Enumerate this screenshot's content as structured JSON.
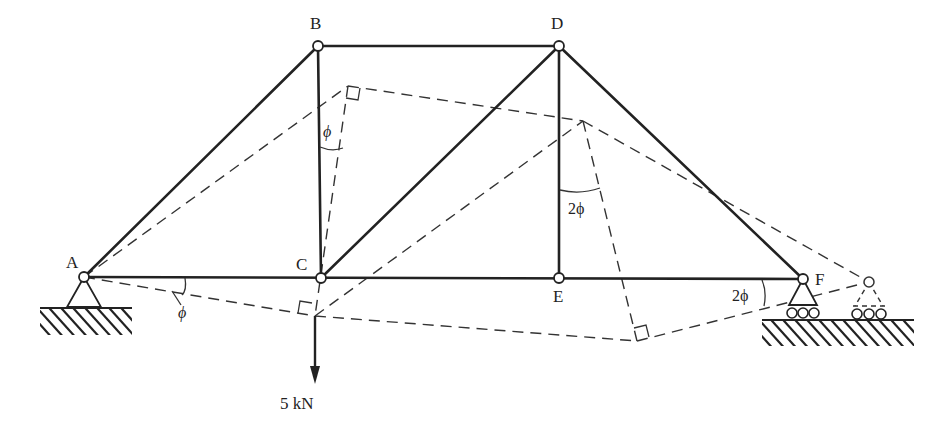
{
  "diagram": {
    "type": "truss-displacement-diagram",
    "joints": [
      {
        "id": "A",
        "label": "A",
        "x": 84,
        "y": 277,
        "support": "pin"
      },
      {
        "id": "B",
        "label": "B",
        "x": 318,
        "y": 46
      },
      {
        "id": "C",
        "label": "C",
        "x": 321,
        "y": 278
      },
      {
        "id": "D",
        "label": "D",
        "x": 559,
        "y": 46
      },
      {
        "id": "E",
        "label": "E",
        "x": 559,
        "y": 278
      },
      {
        "id": "F",
        "label": "F",
        "x": 803,
        "y": 279,
        "support": "roller"
      }
    ],
    "members": [
      "AB",
      "BC",
      "BD",
      "AC",
      "CE",
      "EF",
      "CD",
      "DE",
      "DF"
    ],
    "displaced_joints": [
      {
        "id": "B'",
        "x": 348,
        "y": 86
      },
      {
        "id": "C'",
        "x": 315,
        "y": 316
      },
      {
        "id": "D'",
        "x": 583,
        "y": 121
      },
      {
        "id": "E'",
        "x": 637,
        "y": 341
      },
      {
        "id": "F'",
        "x": 869,
        "y": 282
      }
    ],
    "load": {
      "label": "5 kN",
      "at": "C",
      "direction": "down"
    },
    "angle_labels": [
      {
        "label": "ϕ",
        "location": "between BC and displaced BC"
      },
      {
        "label": "ϕ",
        "location": "at A between AC and displaced AC"
      },
      {
        "label": "2ϕ",
        "location": "between DE and displaced DE"
      },
      {
        "label": "2ϕ",
        "location": "at F between EF and displaced EF"
      }
    ]
  },
  "labels": {
    "A": "A",
    "B": "B",
    "C": "C",
    "D": "D",
    "E": "E",
    "F": "F",
    "load": "5 kN",
    "phi_bc": "ϕ",
    "phi_a": "ϕ",
    "two_phi_de": "2ϕ",
    "two_phi_f": "2ϕ"
  }
}
